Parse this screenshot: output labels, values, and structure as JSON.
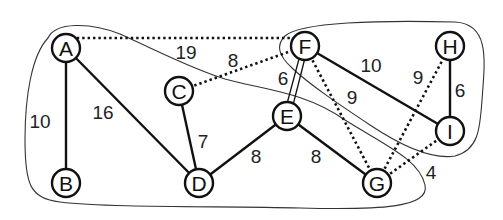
{
  "diagram": {
    "type": "weighted-undirected-graph",
    "nodes": [
      {
        "id": "A",
        "label": "A",
        "x": 66,
        "y": 48
      },
      {
        "id": "B",
        "label": "B",
        "x": 66,
        "y": 183
      },
      {
        "id": "C",
        "label": "C",
        "x": 179,
        "y": 91
      },
      {
        "id": "D",
        "label": "D",
        "x": 199,
        "y": 183
      },
      {
        "id": "E",
        "label": "E",
        "x": 287,
        "y": 116
      },
      {
        "id": "F",
        "label": "F",
        "x": 305,
        "y": 46
      },
      {
        "id": "G",
        "label": "G",
        "x": 377,
        "y": 183
      },
      {
        "id": "H",
        "label": "H",
        "x": 450,
        "y": 46
      },
      {
        "id": "I",
        "label": "I",
        "x": 450,
        "y": 131
      }
    ],
    "edges": [
      {
        "from": "A",
        "to": "B",
        "weight": "10",
        "style": "solid",
        "label_x": 40,
        "label_y": 121
      },
      {
        "from": "A",
        "to": "D",
        "weight": "16",
        "style": "solid",
        "label_x": 103,
        "label_y": 112
      },
      {
        "from": "C",
        "to": "D",
        "weight": "7",
        "style": "solid",
        "label_x": 203,
        "label_y": 141
      },
      {
        "from": "D",
        "to": "E",
        "weight": "8",
        "style": "solid",
        "label_x": 256,
        "label_y": 156
      },
      {
        "from": "E",
        "to": "G",
        "weight": "8",
        "style": "solid",
        "label_x": 316,
        "label_y": 156
      },
      {
        "from": "E",
        "to": "F",
        "weight": "6",
        "style": "double",
        "label_x": 283,
        "label_y": 78
      },
      {
        "from": "F",
        "to": "I",
        "weight": "10",
        "style": "solid",
        "label_x": 371,
        "label_y": 65
      },
      {
        "from": "H",
        "to": "I",
        "weight": "6",
        "style": "solid",
        "label_x": 460,
        "label_y": 90
      },
      {
        "from": "A",
        "to": "F",
        "weight": "19",
        "style": "dotted",
        "label_x": 186,
        "label_y": 52
      },
      {
        "from": "C",
        "to": "F",
        "weight": "8",
        "style": "dotted",
        "label_x": 233,
        "label_y": 60
      },
      {
        "from": "F",
        "to": "G",
        "weight": "9",
        "style": "dotted",
        "label_x": 352,
        "label_y": 97
      },
      {
        "from": "G",
        "to": "H",
        "weight": "9",
        "style": "dotted",
        "label_x": 418,
        "label_y": 77
      },
      {
        "from": "G",
        "to": "I",
        "weight": "4",
        "style": "dotted",
        "label_x": 431,
        "label_y": 172
      }
    ],
    "regions": [
      {
        "name": "left-partition",
        "contains": [
          "A",
          "B",
          "C",
          "D",
          "E",
          "G"
        ]
      },
      {
        "name": "right-partition",
        "contains": [
          "F",
          "H",
          "I"
        ]
      }
    ]
  }
}
